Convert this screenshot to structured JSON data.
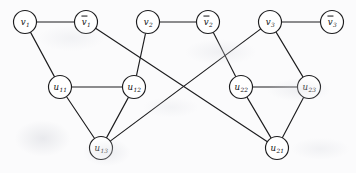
{
  "figure": {
    "kind": "undirected-graph-diagram",
    "background_color": "#fbfbfc",
    "ink_color": "#1d1d1f",
    "node_fill": "#ffffff",
    "node_radius": 11.5
  },
  "nodes": [
    {
      "id": "v1",
      "base": "v",
      "sub": "1",
      "negated": false,
      "x": 25,
      "y": 22,
      "label": "v1"
    },
    {
      "id": "nv1",
      "base": "v",
      "sub": "1",
      "negated": true,
      "x": 86,
      "y": 22,
      "label": "v̅1"
    },
    {
      "id": "v2",
      "base": "v",
      "sub": "2",
      "negated": false,
      "x": 148,
      "y": 22,
      "label": "v2"
    },
    {
      "id": "nv2",
      "base": "v",
      "sub": "2",
      "negated": true,
      "x": 208,
      "y": 22,
      "label": "v̅2"
    },
    {
      "id": "v3",
      "base": "v",
      "sub": "3",
      "negated": false,
      "x": 270,
      "y": 22,
      "label": "v3"
    },
    {
      "id": "nv3",
      "base": "v",
      "sub": "3",
      "negated": true,
      "x": 332,
      "y": 22,
      "label": "v̅3"
    },
    {
      "id": "u11",
      "base": "u",
      "sub": "11",
      "negated": false,
      "x": 60,
      "y": 87,
      "label": "u11"
    },
    {
      "id": "u12",
      "base": "u",
      "sub": "12",
      "negated": false,
      "x": 134,
      "y": 87,
      "label": "u12"
    },
    {
      "id": "u13",
      "base": "u",
      "sub": "13",
      "negated": false,
      "x": 101,
      "y": 148,
      "label": "u13"
    },
    {
      "id": "u22",
      "base": "u",
      "sub": "22",
      "negated": false,
      "x": 241,
      "y": 87,
      "label": "u22"
    },
    {
      "id": "u23",
      "base": "u",
      "sub": "23",
      "negated": false,
      "x": 309,
      "y": 87,
      "label": "u23"
    },
    {
      "id": "u21",
      "base": "u",
      "sub": "21",
      "negated": false,
      "x": 277,
      "y": 148,
      "label": "u21"
    }
  ],
  "edges": [
    {
      "from": "v1",
      "to": "nv1",
      "role": "literal-pair"
    },
    {
      "from": "v2",
      "to": "nv2",
      "role": "literal-pair"
    },
    {
      "from": "v3",
      "to": "nv3",
      "role": "literal-pair"
    },
    {
      "from": "u11",
      "to": "u12",
      "role": "clause-triangle-1"
    },
    {
      "from": "u12",
      "to": "u13",
      "role": "clause-triangle-1"
    },
    {
      "from": "u13",
      "to": "u11",
      "role": "clause-triangle-1"
    },
    {
      "from": "u22",
      "to": "u23",
      "role": "clause-triangle-2"
    },
    {
      "from": "u23",
      "to": "u21",
      "role": "clause-triangle-2"
    },
    {
      "from": "u21",
      "to": "u22",
      "role": "clause-triangle-2"
    },
    {
      "from": "v1",
      "to": "u11",
      "role": "connector"
    },
    {
      "from": "v2",
      "to": "u12",
      "role": "connector"
    },
    {
      "from": "nv1",
      "to": "u21",
      "role": "connector"
    },
    {
      "from": "nv2",
      "to": "u22",
      "role": "connector"
    },
    {
      "from": "v3",
      "to": "u13",
      "role": "connector"
    },
    {
      "from": "v3",
      "to": "u23",
      "role": "connector"
    }
  ]
}
